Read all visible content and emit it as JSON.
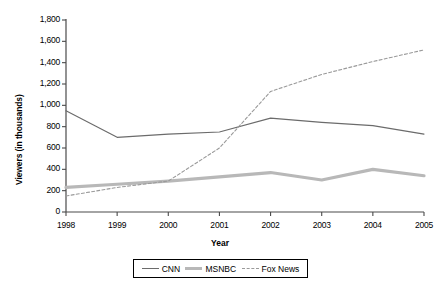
{
  "chart_data": {
    "type": "line",
    "title": "",
    "xlabel": "Year",
    "ylabel": "Viewers (in thousands)",
    "x": [
      1998,
      1999,
      2000,
      2001,
      2002,
      2003,
      2004,
      2005
    ],
    "categories": [
      "1998",
      "1999",
      "2000",
      "2001",
      "2002",
      "2003",
      "2004",
      "2005"
    ],
    "xlim": [
      1998,
      2005
    ],
    "ylim": [
      0,
      1800
    ],
    "yticks": [
      0,
      200,
      400,
      600,
      800,
      1000,
      1200,
      1400,
      1600,
      1800
    ],
    "ytick_labels": [
      "0",
      "200",
      "400",
      "600",
      "800",
      "1,000",
      "1,200",
      "1,400",
      "1,600",
      "1,800"
    ],
    "grid": false,
    "legend_position": "bottom",
    "series": [
      {
        "name": "CNN",
        "style": "solid-thin",
        "color": "#6b6b6b",
        "values": [
          950,
          700,
          730,
          750,
          880,
          840,
          810,
          730
        ]
      },
      {
        "name": "MSNBC",
        "style": "solid-thick",
        "color": "#b8b8b8",
        "values": [
          230,
          260,
          290,
          330,
          370,
          300,
          400,
          340
        ]
      },
      {
        "name": "Fox News",
        "style": "dashed",
        "color": "#9a9a9a",
        "values": [
          150,
          230,
          290,
          600,
          1130,
          1290,
          1410,
          1520
        ]
      }
    ]
  },
  "axis": {
    "y_label": "Viewers (in thousands)",
    "x_label": "Year"
  },
  "legend": {
    "items": [
      {
        "label": "CNN"
      },
      {
        "label": "MSNBC"
      },
      {
        "label": "Fox News"
      }
    ]
  }
}
